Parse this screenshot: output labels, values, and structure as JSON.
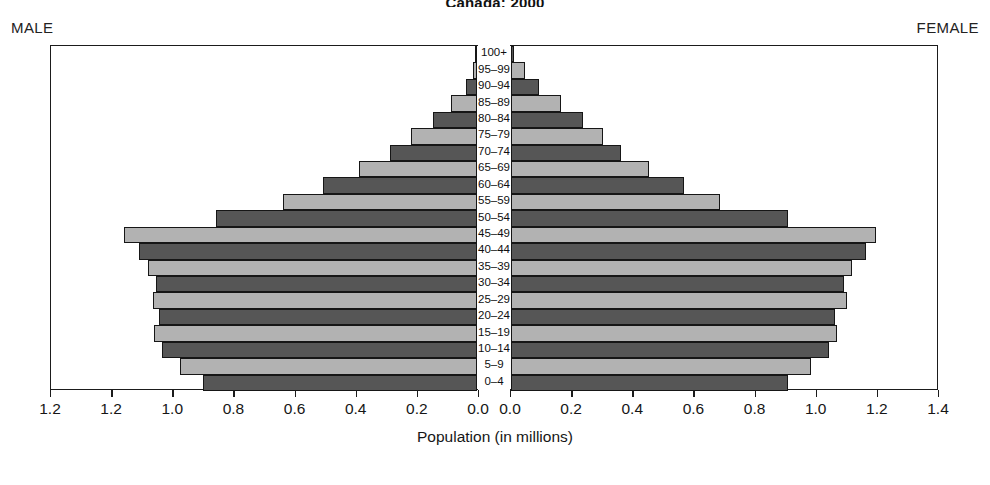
{
  "chart_data": {
    "type": "bar",
    "subtype": "population-pyramid",
    "title": "Canada: 2000",
    "xlabel": "Population (in millions)",
    "ylabel": "",
    "grid": false,
    "legend": "none",
    "left_caption": "MALE",
    "right_caption": "FEMALE",
    "categories": [
      "100+",
      "95–99",
      "90–94",
      "85–89",
      "80–84",
      "75–79",
      "70–74",
      "65–69",
      "60–64",
      "55–59",
      "50–54",
      "45–49",
      "40–44",
      "35–39",
      "30–34",
      "25–29",
      "20–24",
      "15–19",
      "10–14",
      "5–9",
      "0–4"
    ],
    "left_axis": {
      "ticks": [
        "1.2",
        "1.2",
        "1.0",
        "0.8",
        "0.6",
        "0.4",
        "0.2",
        "0.0"
      ],
      "max": 1.4,
      "min": 0.0,
      "direction": "right-to-left"
    },
    "right_axis": {
      "ticks": [
        "0.0",
        "0.2",
        "0.4",
        "0.6",
        "0.8",
        "1.0",
        "1.2",
        "1.4"
      ],
      "max": 1.4,
      "min": 0.0,
      "direction": "left-to-right"
    },
    "series": [
      {
        "name": "MALE",
        "side": "left",
        "values": [
          0.003,
          0.013,
          0.035,
          0.085,
          0.145,
          0.215,
          0.285,
          0.385,
          0.505,
          0.635,
          0.855,
          1.155,
          1.105,
          1.075,
          1.05,
          1.06,
          1.04,
          1.055,
          1.03,
          0.97,
          0.895
        ]
      },
      {
        "name": "FEMALE",
        "side": "right",
        "values": [
          0.01,
          0.045,
          0.09,
          0.165,
          0.235,
          0.3,
          0.36,
          0.45,
          0.565,
          0.685,
          0.905,
          1.195,
          1.16,
          1.115,
          1.09,
          1.1,
          1.06,
          1.065,
          1.04,
          0.98,
          0.905
        ]
      }
    ],
    "colors": {
      "bar_dark": "#565656",
      "bar_light": "#b2b2b2",
      "outline": "#161616",
      "background": "#ffffff",
      "text": "#161616"
    }
  }
}
